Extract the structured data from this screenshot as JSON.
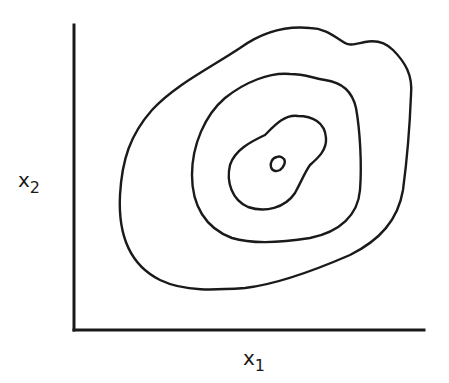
{
  "diagram": {
    "type": "contour_plot",
    "axes": {
      "x_label": {
        "base": "x",
        "subscript": "1"
      },
      "y_label": {
        "base": "x",
        "subscript": "2"
      }
    },
    "contours": {
      "count": 4,
      "description": "Nested closed contour lines of a 2D density, innermost small loop near center-right"
    },
    "colors": {
      "ink": "#1a1a1a",
      "background": "#ffffff"
    }
  }
}
